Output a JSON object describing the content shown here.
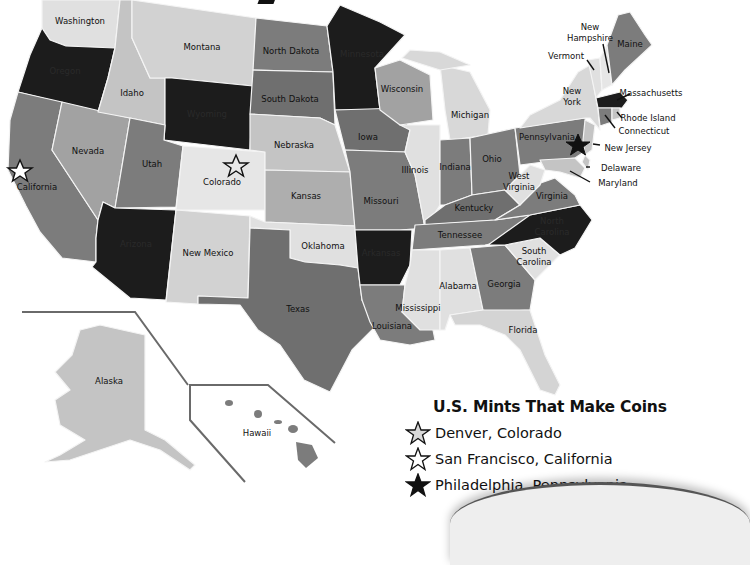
{
  "map": {
    "type": "choropleth",
    "title_fragment_visible": true,
    "colors": {
      "black": "#1c1c1c",
      "dark_gray": "#7c7c7c",
      "mid_gray": "#a2a2a2",
      "light_gray": "#c4c4c4",
      "pale_gray": "#e0e0e0",
      "border": "#f4f4f4",
      "background": "#ffffff"
    },
    "states": {
      "washington": "Washington",
      "oregon": "Oregon",
      "california": "California",
      "nevada": "Nevada",
      "idaho": "Idaho",
      "montana": "Montana",
      "wyoming": "Wyoming",
      "utah": "Utah",
      "arizona": "Arizona",
      "colorado": "Colorado",
      "new_mexico": "New Mexico",
      "north_dakota": "North Dakota",
      "south_dakota": "South Dakota",
      "nebraska": "Nebraska",
      "kansas": "Kansas",
      "oklahoma": "Oklahoma",
      "texas": "Texas",
      "minnesota": "Minnesota",
      "iowa": "Iowa",
      "missouri": "Missouri",
      "arkansas": "Arkansas",
      "louisiana": "Louisiana",
      "wisconsin": "Wisconsin",
      "illinois": "Illinois",
      "michigan": "Michigan",
      "indiana": "Indiana",
      "ohio": "Ohio",
      "kentucky": "Kentucky",
      "tennessee": "Tennessee",
      "mississippi": "Mississippi",
      "alabama": "Alabama",
      "georgia": "Georgia",
      "florida": "Florida",
      "south_carolina_1": "South",
      "south_carolina_2": "Carolina",
      "north_carolina_1": "North",
      "north_carolina_2": "Carolina",
      "virginia": "Virginia",
      "west_virginia_1": "West",
      "west_virginia_2": "Virginia",
      "pennsylvania": "Pennsylvania",
      "new_york_1": "New",
      "new_york_2": "York",
      "vermont": "Vermont",
      "new_hampshire_1": "New",
      "new_hampshire_2": "Hampshire",
      "maine": "Maine",
      "massachusetts": "Massachusetts",
      "rhode_island": "Rhode Island",
      "connecticut": "Connecticut",
      "new_jersey": "New Jersey",
      "delaware": "Delaware",
      "maryland": "Maryland",
      "alaska": "Alaska",
      "hawaii": "Hawaii"
    },
    "markers": [
      {
        "city": "Denver",
        "state": "Colorado",
        "style": "gray-star"
      },
      {
        "city": "San Francisco",
        "state": "California",
        "style": "white-star"
      },
      {
        "city": "Philadelphia",
        "state": "Pennsylvania",
        "style": "black-star"
      }
    ]
  },
  "legend": {
    "title": "U.S. Mints That Make Coins",
    "items": [
      {
        "label": "Denver, Colorado",
        "icon": "gray-star-icon",
        "fill": "#d8d8d8"
      },
      {
        "label": "San Francisco, California",
        "icon": "white-star-icon",
        "fill": "#ffffff"
      },
      {
        "label": "Philadelphia, Pennsylvania",
        "icon": "black-star-icon",
        "fill": "#111111"
      }
    ]
  }
}
